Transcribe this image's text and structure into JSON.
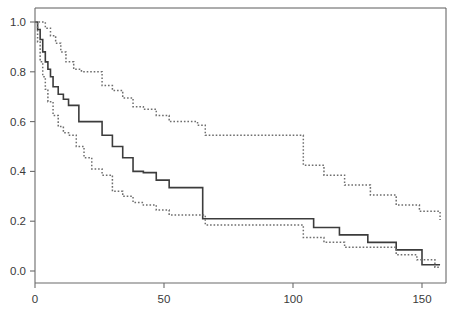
{
  "chart_data": {
    "type": "line",
    "title": "",
    "subtitle": "",
    "xlabel": "",
    "ylabel": "",
    "xlim": [
      0,
      159.5
    ],
    "ylim": [
      0.0,
      1.04
    ],
    "xticks": [
      0,
      50,
      100,
      150
    ],
    "xtick_labels": [
      "0",
      "50",
      "100",
      "150"
    ],
    "yticks": [
      0.0,
      0.2,
      0.4,
      0.6,
      0.8,
      1.0
    ],
    "ytick_labels": [
      "0.0",
      "0.2",
      "0.4",
      "0.6",
      "0.8",
      "1.0"
    ],
    "grid": false,
    "legend": "none",
    "frame": "box",
    "step_type": "post",
    "series": [
      {
        "name": "survival-estimate",
        "style": "solid",
        "color": "#3c3c3c",
        "x": [
          0,
          1,
          2,
          3,
          4,
          5,
          6,
          7,
          9,
          11,
          13,
          17,
          20,
          23,
          26,
          30,
          34,
          38,
          42,
          47,
          52,
          58,
          63,
          65,
          99,
          108,
          118,
          129,
          140,
          144,
          150,
          155,
          157
        ],
        "y": [
          1.0,
          0.97,
          0.93,
          0.88,
          0.84,
          0.81,
          0.78,
          0.74,
          0.71,
          0.69,
          0.665,
          0.6,
          0.6,
          0.6,
          0.545,
          0.5,
          0.455,
          0.4,
          0.395,
          0.365,
          0.335,
          0.335,
          0.335,
          0.21,
          0.21,
          0.175,
          0.145,
          0.115,
          0.085,
          0.085,
          0.025,
          0.025,
          0.025
        ]
      },
      {
        "name": "upper-confidence-limit",
        "style": "dotted",
        "color": "#6e6e6e",
        "x": [
          0,
          2,
          4,
          6,
          8,
          10,
          12,
          15,
          18,
          22,
          26,
          30,
          34,
          38,
          42,
          47,
          52,
          58,
          63,
          66,
          76,
          86,
          99,
          104,
          112,
          120,
          130,
          140,
          149,
          157
        ],
        "y": [
          1.0,
          1.0,
          0.975,
          0.945,
          0.915,
          0.88,
          0.84,
          0.81,
          0.8,
          0.8,
          0.745,
          0.725,
          0.695,
          0.66,
          0.65,
          0.625,
          0.6,
          0.6,
          0.585,
          0.545,
          0.545,
          0.545,
          0.545,
          0.425,
          0.385,
          0.345,
          0.305,
          0.265,
          0.24,
          0.205
        ]
      },
      {
        "name": "lower-confidence-limit",
        "style": "dotted",
        "color": "#6e6e6e",
        "x": [
          0,
          1,
          2,
          3,
          4,
          5,
          7,
          9,
          11,
          13,
          16,
          19,
          22,
          26,
          30,
          34,
          38,
          42,
          47,
          52,
          58,
          63,
          66,
          72,
          80,
          90,
          99,
          104,
          112,
          120,
          130,
          140,
          148,
          155,
          157
        ],
        "y": [
          1.0,
          0.92,
          0.84,
          0.78,
          0.73,
          0.68,
          0.625,
          0.58,
          0.555,
          0.545,
          0.5,
          0.455,
          0.41,
          0.385,
          0.32,
          0.3,
          0.275,
          0.265,
          0.245,
          0.225,
          0.225,
          0.225,
          0.185,
          0.185,
          0.185,
          0.185,
          0.185,
          0.135,
          0.115,
          0.095,
          0.095,
          0.065,
          0.045,
          0.015,
          0.015
        ]
      }
    ]
  },
  "plot_geometry": {
    "left": 35,
    "right": 446,
    "top": 8,
    "bottom": 283,
    "x_zero_px": 35,
    "x_unit_px": 2.58,
    "y_zero_px": 271,
    "y_unit_px": 249
  }
}
